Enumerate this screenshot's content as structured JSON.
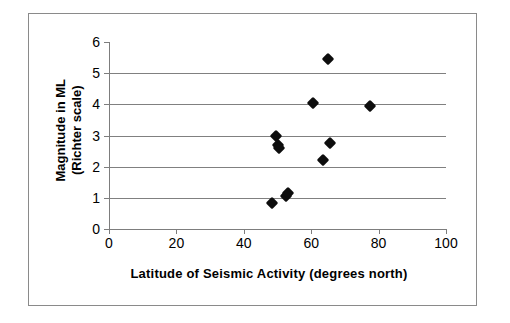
{
  "chart_data": {
    "type": "scatter",
    "title": "",
    "xlabel": "Latitude of Seismic Activity (degrees north)",
    "ylabel_line1": "Magnitude in ML",
    "ylabel_line2": "(Richter scale)",
    "xlim": [
      0,
      100
    ],
    "ylim": [
      0,
      6
    ],
    "xticks": [
      0,
      20,
      40,
      60,
      80,
      100
    ],
    "yticks": [
      0,
      1,
      2,
      3,
      4,
      5,
      6
    ],
    "xtick_labels": [
      "0",
      "20",
      "40",
      "60",
      "80",
      "100"
    ],
    "ytick_labels": [
      "0",
      "1",
      "2",
      "3",
      "4",
      "5",
      "6"
    ],
    "grid": "horizontal",
    "legend": "none",
    "marker": "diamond",
    "marker_color": "#0d0d0d",
    "gridline_color": "#808080",
    "axis_color": "#7d7d7d",
    "border_color": "#8a8a8a",
    "points": [
      {
        "x": 48.5,
        "y": 0.85
      },
      {
        "x": 52.5,
        "y": 1.05
      },
      {
        "x": 53.0,
        "y": 1.15
      },
      {
        "x": 49.5,
        "y": 3.0
      },
      {
        "x": 50.0,
        "y": 2.7
      },
      {
        "x": 50.5,
        "y": 2.6
      },
      {
        "x": 60.5,
        "y": 4.05
      },
      {
        "x": 63.5,
        "y": 2.2
      },
      {
        "x": 65.0,
        "y": 5.45
      },
      {
        "x": 65.5,
        "y": 2.75
      },
      {
        "x": 77.5,
        "y": 3.95
      }
    ]
  }
}
